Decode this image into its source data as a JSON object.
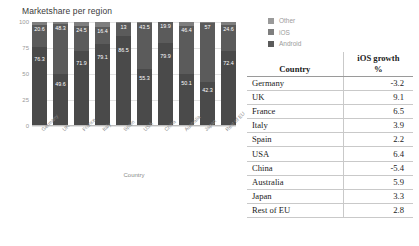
{
  "chart_data": {
    "type": "bar",
    "title": "Marketshare per region",
    "xlabel": "Country",
    "ylabel": "",
    "ylim": [
      0,
      100
    ],
    "yticks": [
      0,
      25,
      50,
      75,
      100
    ],
    "grid": true,
    "stacked": true,
    "legend_position": "right-top",
    "categories": [
      "Germany",
      "UK",
      "France",
      "Italy",
      "Spain",
      "USA",
      "China",
      "Australia",
      "Japan",
      "Rest of EU"
    ],
    "series": [
      {
        "name": "Android",
        "values": [
          76.3,
          49.6,
          71.9,
          79.1,
          86.5,
          55.3,
          79.9,
          50.1,
          42.3,
          72.4
        ]
      },
      {
        "name": "iOS",
        "values": [
          20.6,
          48.3,
          24.5,
          16.4,
          13,
          43.5,
          19.9,
          46.4,
          57,
          24.6
        ]
      },
      {
        "name": "Other",
        "values": [
          3.1,
          2.1,
          3.6,
          4.5,
          0.5,
          1.2,
          0.2,
          3.5,
          0.7,
          3.0
        ]
      }
    ],
    "bar_labels": {
      "top": [
        "20.6",
        "48.3",
        "24.5",
        "16.4",
        "13",
        "43.5",
        "19.9",
        "46.4",
        "57",
        "24.6"
      ],
      "bottom": [
        "76.3",
        "49.6",
        "71.9",
        "79.1",
        "86.5",
        "55.3",
        "79.9",
        "50.1",
        "42.3",
        "72.4"
      ]
    },
    "colors": {
      "other": "#7e7e7e",
      "ios": "#5b5b5b",
      "android": "#4a4a4a",
      "grid": "#e3e3e3",
      "axis": "#bdbdbd"
    }
  },
  "legend": {
    "items": [
      {
        "label": "Other",
        "color": "#9a9a9a"
      },
      {
        "label": "iOS",
        "color": "#7e7e7e"
      },
      {
        "label": "Android",
        "color": "#5b5b5b"
      }
    ]
  },
  "table": {
    "headers": {
      "country": "Country",
      "growth_line1": "iOS growth",
      "growth_line2": "%"
    },
    "rows": [
      {
        "country": "Germany",
        "growth": "-3.2"
      },
      {
        "country": "UK",
        "growth": "9.1"
      },
      {
        "country": "France",
        "growth": "6.5"
      },
      {
        "country": "Italy",
        "growth": "3.9"
      },
      {
        "country": "Spain",
        "growth": "2.2"
      },
      {
        "country": "USA",
        "growth": "6.4"
      },
      {
        "country": "China",
        "growth": "-5.4"
      },
      {
        "country": "Australia",
        "growth": "5.9"
      },
      {
        "country": "Japan",
        "growth": "3.3"
      },
      {
        "country": "Rest of EU",
        "growth": "2.8"
      }
    ]
  }
}
